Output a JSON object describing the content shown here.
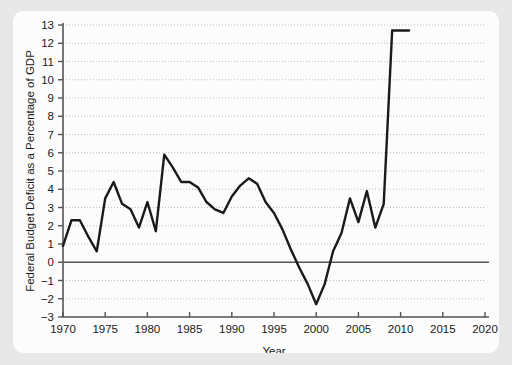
{
  "chart_data": {
    "type": "line",
    "title": "",
    "xlabel": "Year",
    "ylabel": "Federal Budget Deficit as a Percentage of GDP",
    "xlim": [
      1970,
      2020
    ],
    "ylim": [
      -3,
      13
    ],
    "grid": true,
    "grid_style": "dotted-horizontal",
    "legend": "none",
    "xticks": [
      1970,
      1975,
      1980,
      1985,
      1990,
      1995,
      2000,
      2005,
      2010,
      2015,
      2020
    ],
    "xtick_labels": [
      "1970",
      "1975",
      "1980",
      "1985",
      "1990",
      "1995",
      "2000",
      "2005",
      "2010",
      "2015",
      "2020"
    ],
    "yticks": [
      -3,
      -2,
      -1,
      0,
      1,
      2,
      3,
      4,
      5,
      6,
      7,
      8,
      9,
      10,
      11,
      12,
      13
    ],
    "ytick_labels": [
      "−3",
      "−2",
      "−1",
      "0",
      "1",
      "2",
      "3",
      "4",
      "5",
      "6",
      "7",
      "8",
      "9",
      "10",
      "11",
      "12",
      "13"
    ],
    "zero_line": 0,
    "line_color": "#1a1a1a",
    "line_width": 2.4,
    "x": [
      1970,
      1971,
      1972,
      1973,
      1974,
      1975,
      1976,
      1977,
      1978,
      1979,
      1980,
      1981,
      1982,
      1983,
      1984,
      1985,
      1986,
      1987,
      1988,
      1989,
      1990,
      1991,
      1992,
      1993,
      1994,
      1995,
      1996,
      1997,
      1998,
      1999,
      2000,
      2001,
      2002,
      2003,
      2004,
      2005,
      2006,
      2007,
      2008,
      2009,
      2010,
      2011
    ],
    "y": [
      0.9,
      2.3,
      2.3,
      1.4,
      0.6,
      3.5,
      4.4,
      3.2,
      2.9,
      1.9,
      3.3,
      1.7,
      5.9,
      5.2,
      4.4,
      4.4,
      4.1,
      3.3,
      2.9,
      2.7,
      3.6,
      4.2,
      4.6,
      4.3,
      3.3,
      2.7,
      1.8,
      0.7,
      -0.3,
      -1.2,
      -2.3,
      -1.2,
      0.6,
      1.6,
      3.5,
      2.2,
      3.9,
      1.9,
      3.2,
      12.7,
      12.7,
      12.7
    ]
  },
  "axis": {
    "y_title": "Federal Budget Deficit as a Percentage of GDP",
    "x_title": "Year"
  }
}
